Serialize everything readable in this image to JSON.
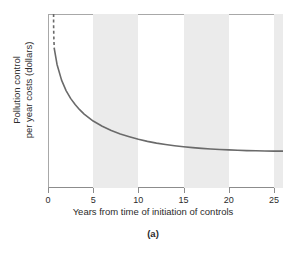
{
  "figure": {
    "caption": "(a)",
    "background": "#ffffff"
  },
  "chart_data": {
    "type": "line",
    "title": "",
    "subtitle": "",
    "xlabel": "Years from time of initiation of controls",
    "ylabel_line1": "Pollution control",
    "ylabel_line2": "per year costs (dollars)",
    "ylabel": "Pollution control per year costs (dollars)",
    "xlim": [
      0,
      26
    ],
    "ylim": [
      0,
      100
    ],
    "xticks": [
      0,
      5,
      10,
      15,
      20,
      25
    ],
    "xtick_labels": [
      "0",
      "5",
      "10",
      "15",
      "20",
      "25"
    ],
    "yticks": [],
    "ytick_labels": [],
    "grid": false,
    "legend": null,
    "legend_position": "none",
    "line_color": "#6a6a6a",
    "line_width": 1.6,
    "shaded_band_color": "#ebebeb",
    "shaded_bands": [
      {
        "x0": 5,
        "x1": 10
      },
      {
        "x0": 15,
        "x1": 20
      },
      {
        "x0": 25,
        "x1": 26
      }
    ],
    "annotations": [
      {
        "text": "curve broken (dashed) above the top of the axis near year 0.6",
        "x": 0.6,
        "y": 100
      }
    ],
    "series": [
      {
        "name": "Pollution control cost per year",
        "style": "dashed",
        "comment": "near-vertical broken segment at the very start of the curve",
        "x": [
          0.62,
          0.62,
          0.64,
          0.66,
          0.7
        ],
        "y": [
          100,
          94,
          88,
          84,
          80
        ]
      },
      {
        "name": "Pollution control cost per year",
        "style": "solid",
        "x": [
          0.7,
          1,
          1.5,
          2,
          2.5,
          3,
          3.5,
          4,
          5,
          6,
          7,
          8,
          9,
          10,
          11,
          12,
          13,
          14,
          15,
          16,
          17,
          18,
          19,
          20,
          21,
          22,
          23,
          24,
          25,
          26
        ],
        "y": [
          80,
          71,
          62,
          56,
          51.5,
          48,
          45,
          42.5,
          38.5,
          35.5,
          33,
          31,
          29.5,
          28,
          26.8,
          25.8,
          25,
          24.3,
          23.7,
          23.2,
          22.8,
          22.4,
          22.1,
          21.9,
          21.7,
          21.5,
          21.4,
          21.3,
          21.2,
          21.2
        ]
      }
    ]
  }
}
